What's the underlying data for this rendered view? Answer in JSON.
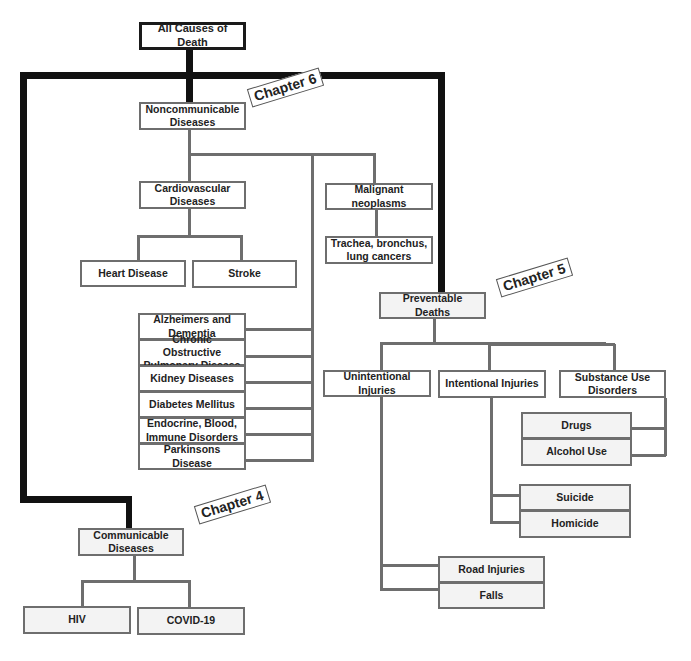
{
  "root": "All Causes of Death",
  "chapters": {
    "ch6": "Chapter 6",
    "ch5": "Chapter 5",
    "ch4": "Chapter 4"
  },
  "noncommunicable": {
    "label": "Noncommunicable Diseases",
    "cardiovascular": {
      "label": "Cardiovascular Diseases",
      "children": [
        "Heart Disease",
        "Stroke"
      ]
    },
    "malignant": {
      "label": "Malignant neoplasms",
      "children": [
        "Trachea, bronchus, lung cancers"
      ]
    },
    "others": [
      "Alzheimers and Dementia",
      "Chronic Obstructive Pulmonary Disease",
      "Kidney Diseases",
      "Diabetes Mellitus",
      "Endocrine, Blood, Immune Disorders",
      "Parkinsons Disease"
    ]
  },
  "preventable": {
    "label": "Preventable Deaths",
    "unintentional": {
      "label": "Unintentional Injuries",
      "children": [
        "Road Injuries",
        "Falls"
      ]
    },
    "intentional": {
      "label": "Intentional Injuries",
      "children": [
        "Suicide",
        "Homicide"
      ]
    },
    "substance": {
      "label": "Substance Use Disorders",
      "children": [
        "Drugs",
        "Alcohol Use"
      ]
    }
  },
  "communicable": {
    "label": "Communicable Diseases",
    "children": [
      "HIV",
      "COVID-19"
    ]
  },
  "colors": {
    "thick_line": "#111111",
    "thin_line": "#6e6e6e",
    "box_fill": "#f3f3f3"
  }
}
